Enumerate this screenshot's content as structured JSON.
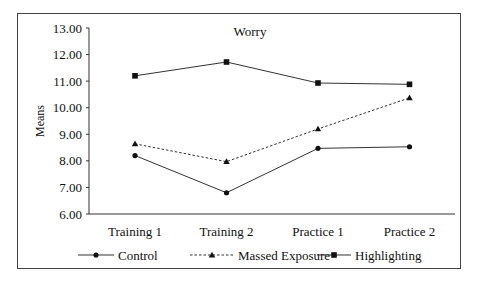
{
  "chart_data": {
    "type": "line",
    "title": "Worry",
    "xlabel": "",
    "ylabel": "Means",
    "categories": [
      "Training 1",
      "Training 2",
      "Practice 1",
      "Practice 2"
    ],
    "ylim": [
      6.0,
      13.0
    ],
    "yticks": [
      "6.00",
      "7.00",
      "8.00",
      "9.00",
      "10.00",
      "11.00",
      "12.00",
      "13.00"
    ],
    "grid": false,
    "legend_position": "bottom",
    "series": [
      {
        "name": "Control",
        "marker": "circle",
        "line": "solid",
        "values": [
          8.2,
          6.8,
          8.47,
          8.53
        ]
      },
      {
        "name": "Massed Exposure",
        "marker": "triangle",
        "line": "dashed",
        "values": [
          8.64,
          7.97,
          9.2,
          10.37
        ]
      },
      {
        "name": "Highlighting",
        "marker": "square",
        "line": "solid",
        "values": [
          11.2,
          11.72,
          10.93,
          10.88
        ]
      }
    ]
  }
}
